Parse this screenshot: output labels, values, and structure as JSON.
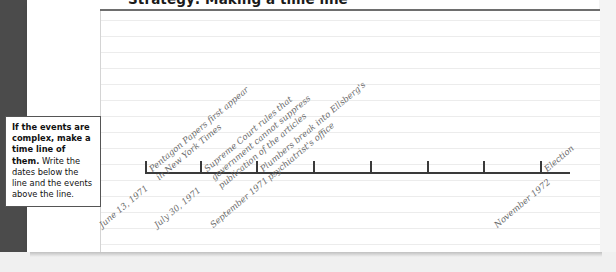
{
  "header": {
    "title": "Strategy: Making a time line"
  },
  "callout": {
    "bold_text": "If the events are complex, make a time line of them.",
    "rest_text": " Write the dates below the line and the events above the line."
  },
  "timeline": {
    "axis_label": "time-line-axis",
    "tick_count": 8,
    "tick_positions_px": [
      145,
      200,
      256,
      313,
      370,
      427,
      483,
      540
    ],
    "events": [
      {
        "id": "pentagon-papers",
        "lines": [
          "Pentagon Papers first appear",
          "in New York Times"
        ],
        "text": "Pentagon Papers first appear in New York Times",
        "x": 145
      },
      {
        "id": "supreme-court",
        "lines": [
          "Supreme Court rules that",
          "government cannot suppress",
          "publication of the articles"
        ],
        "text": "Supreme Court rules that government cannot suppress publication of the articles",
        "x": 200
      },
      {
        "id": "plumbers-break-in",
        "lines": [
          "Plumbers break into Ellsberg's",
          "psychiatrist's office"
        ],
        "text": "Plumbers break into Ellsberg's psychiatrist's office",
        "x": 256
      },
      {
        "id": "election",
        "lines": [
          "Election"
        ],
        "text": "Election",
        "x": 540
      }
    ],
    "dates": [
      {
        "id": "june-13-1971",
        "text": "June 13, 1971",
        "x": 145
      },
      {
        "id": "july-30-1971",
        "text": "July 30, 1971",
        "x": 200
      },
      {
        "id": "september-1971",
        "text": "September 1971",
        "x": 256
      },
      {
        "id": "november-1972",
        "text": "November 1972",
        "x": 540
      }
    ]
  },
  "style": {
    "binding_color": "#4b4b4b",
    "page_color": "#ffffff",
    "rule_color": "#ececec",
    "ink_color": "#6a6a6a",
    "axis_color": "#3a3a3a"
  },
  "chart_data": {
    "type": "timeline",
    "title": "Strategy: Making a time line",
    "axis_orientation": "horizontal",
    "categories": [
      "June 13, 1971",
      "July 30, 1971",
      "September 1971",
      "November 1972"
    ],
    "annotations": [
      "Pentagon Papers first appear in New York Times",
      "Supreme Court rules that government cannot suppress publication of the articles",
      "Plumbers break into Ellsberg's psychiatrist's office",
      "Election"
    ],
    "tick_count": 8,
    "grid": false,
    "legend": "none"
  }
}
